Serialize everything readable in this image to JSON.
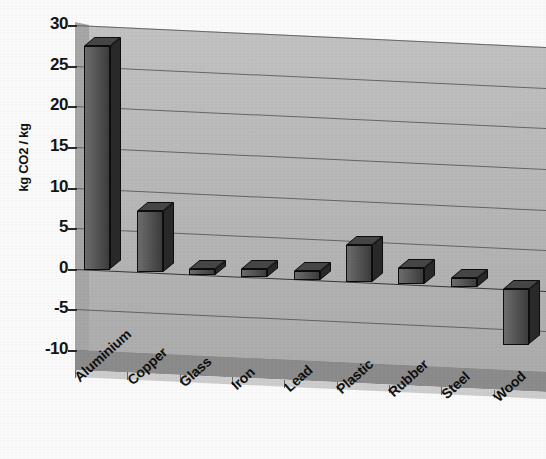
{
  "chart_data": {
    "type": "bar",
    "title": "",
    "xlabel": "",
    "ylabel": "kg CO2 / kg",
    "ylim": [
      -10,
      30
    ],
    "ytick_step": 5,
    "yticks": [
      30,
      25,
      20,
      15,
      10,
      5,
      0,
      -5,
      -10
    ],
    "ytick_labels": [
      "30",
      "25",
      "20",
      "15",
      "10",
      "5",
      "0",
      "-5",
      "-10"
    ],
    "grid": true,
    "legend": "none",
    "style": "3d-column",
    "categories": [
      "Aluminium",
      "Copper",
      "Glass",
      "Iron",
      "Lead",
      "Plastic",
      "Rubber",
      "Steel",
      "Wood"
    ],
    "values": [
      27.5,
      7.5,
      0.7,
      1.0,
      1.1,
      4.6,
      2.0,
      1.1,
      -6.8
    ],
    "series": [
      {
        "name": "kg CO2 / kg",
        "values": [
          27.5,
          7.5,
          0.7,
          1.0,
          1.1,
          4.6,
          2.0,
          1.1,
          -6.8
        ]
      }
    ],
    "colors": {
      "bar_face": "#585858",
      "bar_side": "#2a2a2a",
      "bar_top": "#474747",
      "bar_outline": "#0d0d0d",
      "plot_back_wall": "#bfbfbf",
      "plot_floor": "#8d8d8d",
      "gridline": "#4a4a4a",
      "text": "#101010",
      "background": "#ffffff"
    }
  }
}
